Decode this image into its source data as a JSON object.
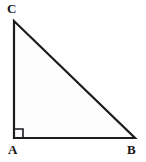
{
  "figure": {
    "kind": "right-triangle-diagram",
    "background_color": "#ffffff",
    "stroke_color": "#1b1c20",
    "fill_color": "#fdfdfd",
    "stroke_width": 2.2,
    "canvas": {
      "width": 146,
      "height": 162
    },
    "vertices": [
      {
        "id": "C",
        "label": "C",
        "x": 14,
        "y": 21,
        "label_x": 7,
        "label_y": 2
      },
      {
        "id": "A",
        "label": "A",
        "x": 14,
        "y": 138,
        "label_x": 8,
        "label_y": 143
      },
      {
        "id": "B",
        "label": "B",
        "x": 135,
        "y": 138,
        "label_x": 127,
        "label_y": 143
      }
    ],
    "edges": [
      {
        "id": "AC",
        "from": "A",
        "to": "C",
        "role": "vertical-leg"
      },
      {
        "id": "AB",
        "from": "A",
        "to": "B",
        "role": "horizontal-leg"
      },
      {
        "id": "CB",
        "from": "C",
        "to": "B",
        "role": "hypotenuse"
      }
    ],
    "right_angle_marker": {
      "at_vertex": "A",
      "size": 9,
      "x": 14,
      "y": 129
    },
    "polygon_points": "14,21 14,138 135,138",
    "right_angle_points": "14,129 23,129 23,138"
  }
}
